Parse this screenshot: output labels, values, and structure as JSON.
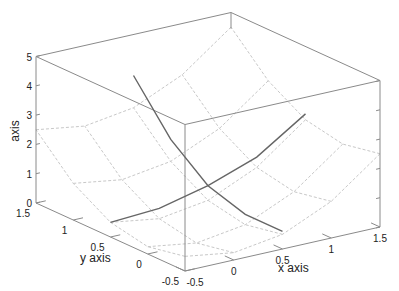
{
  "chart_data": {
    "type": "surface3d",
    "title": "",
    "xlabel": "x axis",
    "ylabel": "y axis",
    "zlabel": "axis",
    "xlim": [
      -0.5,
      1.5
    ],
    "ylim": [
      -0.5,
      1.5
    ],
    "zlim": [
      0,
      5
    ],
    "x_ticks": [
      "-0.5",
      "0",
      "0.5",
      "1",
      "1.5"
    ],
    "y_ticks": [
      "-0.5",
      "0",
      "0.5",
      "1",
      "1.5"
    ],
    "z_ticks": [
      "0",
      "1",
      "2",
      "3",
      "4",
      "5"
    ],
    "surface": {
      "function": "z = x^2 + y^2",
      "grid_x": [
        -0.5,
        0,
        0.5,
        1,
        1.5
      ],
      "grid_y": [
        -0.5,
        0,
        0.5,
        1,
        1.5
      ],
      "style": "dashed light gray wireframe"
    },
    "series": [
      {
        "name": "slice x=0.5",
        "points": [
          [
            0.5,
            1.5,
            3.6
          ],
          [
            0.5,
            1.0,
            2.0
          ],
          [
            0.5,
            0.5,
            1.0
          ],
          [
            0.5,
            0.0,
            0.6
          ],
          [
            0.5,
            -0.5,
            0.6
          ]
        ]
      },
      {
        "name": "slice y=0.5",
        "points": [
          [
            -0.5,
            0.5,
            0.5
          ],
          [
            0.0,
            0.5,
            0.6
          ],
          [
            0.5,
            0.5,
            1.0
          ],
          [
            1.0,
            0.5,
            1.6
          ],
          [
            1.5,
            0.5,
            2.7
          ]
        ]
      }
    ],
    "colors": {
      "box": "#8a8a8a",
      "mesh": "#c8c8c8",
      "curve": "#666666",
      "text": "#222222"
    }
  }
}
